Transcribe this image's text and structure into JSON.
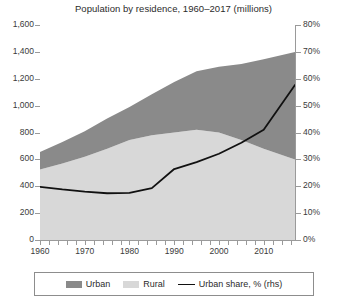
{
  "chart_data": {
    "type": "area",
    "title": "Population by residence, 1960–2017 (millions)",
    "xlabel": "",
    "ylabel": "",
    "ylim": [
      0,
      1600
    ],
    "y2lim": [
      0,
      80
    ],
    "grid": true,
    "legend_position": "bottom",
    "x": [
      1960,
      1965,
      1970,
      1975,
      1980,
      1985,
      1990,
      1995,
      2000,
      2005,
      2010,
      2017
    ],
    "x_tick_labels": [
      "1960",
      "1970",
      "1980",
      "1990",
      "2000",
      "2010"
    ],
    "x_tick_values": [
      1960,
      1970,
      1980,
      1990,
      2000,
      2010
    ],
    "y_tick_labels": [
      "0",
      "200",
      "400",
      "600",
      "800",
      "1,000",
      "1,200",
      "1,400",
      "1,600"
    ],
    "y_tick_values": [
      0,
      200,
      400,
      600,
      800,
      1000,
      1200,
      1400,
      1600
    ],
    "y2_tick_labels": [
      "0%",
      "10%",
      "20%",
      "30%",
      "40%",
      "50%",
      "60%",
      "70%",
      "80%"
    ],
    "y2_tick_values": [
      0,
      10,
      20,
      30,
      40,
      50,
      60,
      70,
      80
    ],
    "series": [
      {
        "name": "Rural",
        "type": "area",
        "stack": "population",
        "color": "#d8d8d8",
        "values": [
          525,
          570,
          620,
          680,
          745,
          780,
          800,
          820,
          800,
          745,
          680,
          600
        ]
      },
      {
        "name": "Urban",
        "type": "area",
        "stack": "population",
        "color": "#8a8a8a",
        "values": [
          130,
          160,
          190,
          225,
          245,
          305,
          375,
          435,
          490,
          565,
          665,
          800
        ]
      },
      {
        "name": "Urban share, % (rhs)",
        "type": "line",
        "axis": "right",
        "color": "#111111",
        "values": [
          19.8,
          18.8,
          18.0,
          17.4,
          17.5,
          19.3,
          26.4,
          29.0,
          32.1,
          36.2,
          41.0,
          57.7
        ]
      }
    ]
  },
  "legend": {
    "items": [
      {
        "label": "Urban",
        "marker": "swatch",
        "color": "#8a8a8a"
      },
      {
        "label": "Rural",
        "marker": "swatch",
        "color": "#d8d8d8"
      },
      {
        "label": "Urban share, % (rhs)",
        "marker": "line",
        "color": "#111111"
      }
    ]
  }
}
